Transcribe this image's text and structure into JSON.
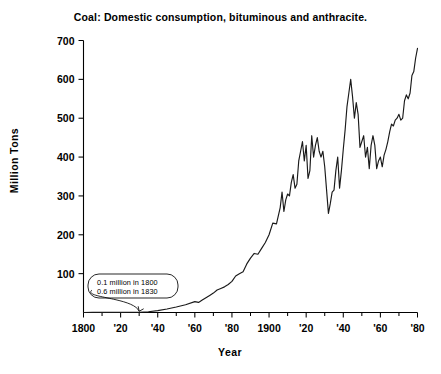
{
  "chart_data": {
    "type": "line",
    "title": "Coal: Domestic consumption, bituminous and anthracite.",
    "xlabel": "Year",
    "ylabel": "Million Tons",
    "xlim": [
      1800,
      1980
    ],
    "ylim": [
      0,
      730
    ],
    "grid": false,
    "legend": null,
    "units": "million tons",
    "y_ticks": [
      100,
      200,
      300,
      400,
      500,
      600,
      700
    ],
    "y_tick_labels": [
      "100",
      "200",
      "300",
      "400",
      "500",
      "600",
      "700"
    ],
    "x_ticks": [
      1800,
      1820,
      1840,
      1860,
      1880,
      1900,
      1920,
      1940,
      1960,
      1980
    ],
    "x_tick_labels": [
      "1800",
      "'20",
      "'40",
      "'60",
      "'80",
      "1900",
      "'20",
      "'40",
      "'60",
      "'80"
    ],
    "x_minor_ticks": [
      1810,
      1830,
      1850,
      1870,
      1890,
      1910,
      1930,
      1950,
      1970
    ],
    "annotations": [
      {
        "name": "early-values-callout",
        "lines": [
          "0.1 million in 1800",
          "0.6 million in 1830"
        ],
        "points_to_year": 1830,
        "points_to_value": 0.6
      }
    ],
    "x": [
      1800,
      1805,
      1810,
      1815,
      1820,
      1825,
      1830,
      1835,
      1840,
      1845,
      1850,
      1855,
      1860,
      1862,
      1864,
      1866,
      1868,
      1870,
      1872,
      1874,
      1876,
      1878,
      1880,
      1882,
      1884,
      1886,
      1888,
      1890,
      1892,
      1894,
      1896,
      1898,
      1900,
      1902,
      1904,
      1906,
      1907,
      1908,
      1909,
      1910,
      1911,
      1912,
      1913,
      1914,
      1915,
      1916,
      1917,
      1918,
      1919,
      1920,
      1921,
      1922,
      1923,
      1924,
      1925,
      1926,
      1927,
      1928,
      1929,
      1930,
      1931,
      1932,
      1933,
      1934,
      1935,
      1936,
      1937,
      1938,
      1939,
      1940,
      1941,
      1942,
      1943,
      1944,
      1945,
      1946,
      1947,
      1948,
      1949,
      1950,
      1951,
      1952,
      1953,
      1954,
      1955,
      1956,
      1957,
      1958,
      1959,
      1960,
      1961,
      1962,
      1963,
      1964,
      1965,
      1966,
      1967,
      1968,
      1969,
      1970,
      1971,
      1972,
      1973,
      1974,
      1975,
      1976,
      1977,
      1978,
      1979,
      1980
    ],
    "y": [
      0.1,
      0.2,
      0.3,
      0.4,
      0.5,
      0.55,
      0.6,
      2,
      5,
      9,
      14,
      20,
      28,
      26,
      32,
      38,
      44,
      50,
      58,
      62,
      66,
      72,
      80,
      94,
      100,
      105,
      125,
      140,
      152,
      150,
      165,
      180,
      200,
      230,
      228,
      270,
      310,
      260,
      290,
      305,
      300,
      335,
      355,
      320,
      330,
      390,
      415,
      440,
      390,
      430,
      345,
      365,
      455,
      400,
      430,
      450,
      415,
      400,
      415,
      375,
      315,
      255,
      280,
      310,
      315,
      365,
      400,
      320,
      365,
      420,
      470,
      530,
      565,
      600,
      555,
      500,
      540,
      510,
      425,
      440,
      455,
      400,
      425,
      370,
      430,
      455,
      430,
      370,
      390,
      400,
      375,
      405,
      420,
      440,
      465,
      485,
      480,
      495,
      500,
      510,
      495,
      500,
      545,
      560,
      550,
      565,
      610,
      620,
      655,
      680,
      710
    ],
    "line_color": "#1a1a1a",
    "background_color": "#ffffff"
  }
}
